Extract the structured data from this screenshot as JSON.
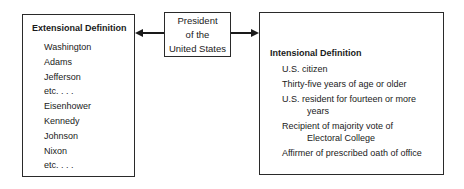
{
  "center": {
    "lines": [
      "President",
      "of the",
      "United States"
    ]
  },
  "extensional": {
    "title": "Extensional Definition",
    "items": [
      "Washington",
      "Adams",
      "Jefferson",
      "etc. . . .",
      "Eisenhower",
      "Kennedy",
      "Johnson",
      "Nixon",
      "etc. . . ."
    ]
  },
  "intensional": {
    "title": "Intensional Definition",
    "items": [
      {
        "line1": "U.S. citizen",
        "line2": ""
      },
      {
        "line1": "Thirty-five years of age or older",
        "line2": ""
      },
      {
        "line1": "U.S. resident for fourteen or more",
        "line2": "years"
      },
      {
        "line1": "Recipient of majority vote of",
        "line2": "Electoral College"
      },
      {
        "line1": "Affirmer of prescribed oath of office",
        "line2": ""
      }
    ]
  },
  "arrows": [
    {
      "from": "center",
      "to": "extensional",
      "direction": "left"
    },
    {
      "from": "center",
      "to": "intensional",
      "direction": "right"
    }
  ]
}
